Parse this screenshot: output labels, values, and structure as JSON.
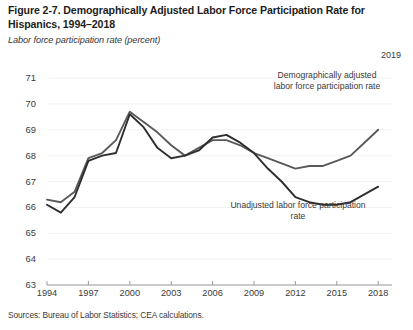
{
  "figure": {
    "title": "Figure 2-7. Demographically Adjusted Labor Force Participation Rate for Hispanics, 1994–2018",
    "subtitle": "Labor force participation rate (percent)",
    "end_year_label": "2019",
    "source": "Sources: Bureau of Labor Statistics; CEA calculations."
  },
  "annotations": {
    "adjusted": "Demographically adjusted labor force participation rate",
    "unadjusted": "Unadjusted labor force participation rate"
  },
  "chart_data": {
    "type": "line",
    "title": "Figure 2-7. Demographically Adjusted Labor Force Participation Rate for Hispanics, 1994–2018",
    "xlabel": "",
    "ylabel": "Labor force participation rate (percent)",
    "xlim": [
      1994,
      2019
    ],
    "ylim": [
      63,
      71
    ],
    "ytick_labels": [
      "71",
      "70",
      "69",
      "68",
      "67",
      "66",
      "65",
      "64",
      "63"
    ],
    "yticks": [
      71,
      70,
      69,
      68,
      67,
      66,
      65,
      64,
      63
    ],
    "xticks": [
      1994,
      1997,
      2000,
      2003,
      2006,
      2009,
      2012,
      2015,
      2018
    ],
    "xtick_labels": [
      "1994",
      "1997",
      "2000",
      "2003",
      "2006",
      "2009",
      "2012",
      "2015",
      "2018"
    ],
    "grid": false,
    "legend": "annotations-inline",
    "x": [
      1994,
      1995,
      1996,
      1997,
      1998,
      1999,
      2000,
      2001,
      2002,
      2003,
      2004,
      2005,
      2006,
      2007,
      2008,
      2009,
      2010,
      2011,
      2012,
      2013,
      2014,
      2015,
      2016,
      2017,
      2018
    ],
    "series": [
      {
        "name": "Demographically adjusted labor force participation rate",
        "color": "#5a5a5a",
        "values": [
          66.3,
          66.2,
          66.6,
          67.9,
          68.1,
          68.6,
          69.7,
          69.3,
          68.9,
          68.4,
          68.0,
          68.3,
          68.6,
          68.6,
          68.4,
          68.1,
          67.9,
          67.7,
          67.5,
          67.6,
          67.6,
          67.8,
          68.0,
          68.5,
          69.0
        ]
      },
      {
        "name": "Unadjusted labor force participation rate",
        "color": "#2e2e2e",
        "values": [
          66.1,
          65.8,
          66.4,
          67.8,
          68.0,
          68.1,
          69.6,
          69.1,
          68.3,
          67.9,
          68.0,
          68.2,
          68.7,
          68.8,
          68.5,
          68.1,
          67.5,
          67.0,
          66.4,
          66.2,
          66.1,
          66.1,
          66.2,
          66.5,
          66.8
        ]
      }
    ]
  }
}
